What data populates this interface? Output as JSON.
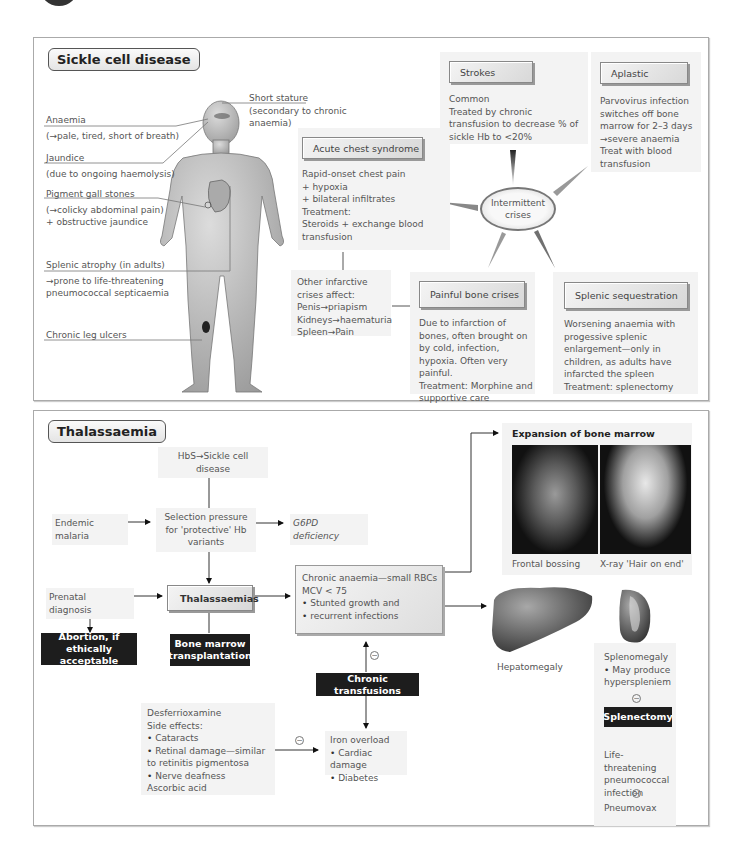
{
  "sickle": {
    "title": "Sickle cell disease",
    "body_labels": {
      "short_stature": "Short stature",
      "short_stature_note": "(secondary to chronic anaemia)",
      "anaemia": "Anaemia",
      "anaemia_note": "(→pale, tired, short of breath)",
      "jaundice": "Jaundice",
      "jaundice_note": "(due to ongoing haemolysis)",
      "gallstones": "Pigment gall stones",
      "gallstones_note1": "(→colicky abdominal pain)",
      "gallstones_note2": "+ obstructive jaundice",
      "splenic_atrophy": "Splenic atrophy (in adults)",
      "splenic_atrophy_note": "→prone to life-threatening pneumococcal septicaemia",
      "leg_ulcers": "Chronic leg ulcers"
    },
    "center": "Intermittent crises",
    "crises": {
      "strokes": {
        "title": "Strokes",
        "text": "Common\nTreated by chronic transfusion to decrease % of sickle Hb to <20%"
      },
      "aplastic": {
        "title": "Aplastic",
        "text": "Parvovirus infection switches off bone marrow for 2–3 days →severe anaemia\nTreat with blood transfusion"
      },
      "acute_chest": {
        "title": "Acute chest syndrome",
        "text": "Rapid-onset chest pain\n+ hypoxia\n+ bilateral infiltrates\nTreatment:\nSteroids + exchange blood transfusion"
      },
      "other_infarctive": {
        "text": "Other infarctive crises affect:\nPenis→priapism\nKidneys→haematuria\nSpleen→Pain"
      },
      "bone": {
        "title": "Painful bone crises",
        "text": "Due to infarction of bones, often brought on by cold, infection, hypoxia. Often very painful.\nTreatment: Morphine and supportive care"
      },
      "splenic_seq": {
        "title": "Splenic sequestration",
        "text": "Worsening anaemia with progessive splenic enlargement—only in children, as adults have infarcted the spleen\nTreatment: splenectomy"
      }
    }
  },
  "thal": {
    "title": "Thalassaemia",
    "hbs": "HbS→Sickle cell disease",
    "malaria": "Endemic malaria",
    "selection": "Selection pressure for 'protective' Hb variants",
    "g6pd": "G6PD deficiency",
    "prenatal": "Prenatal diagnosis",
    "thalassaemias": "Thalassaemias",
    "abortion": "Abortion, if ethically acceptable",
    "bmt": "Bone marrow transplantation",
    "chronic_anaemia": {
      "line1": "Chronic anaemia—small RBCs",
      "line2": "MCV < 75",
      "bullets": [
        "Stunted growth and",
        "recurrent infections"
      ]
    },
    "chronic_transfusions": "Chronic transfusions",
    "desferrioxamine": {
      "title": "Desferrioxamine",
      "side_effects": "Side effects:",
      "bullets": [
        "Cataracts",
        "Retinal damage—similar to retinitis pigmentosa",
        "Nerve deafness"
      ],
      "footer": "Ascorbic acid"
    },
    "iron_overload": {
      "title": "Iron overload",
      "bullets": [
        "Cardiac damage",
        "Diabetes"
      ]
    },
    "expansion": {
      "title": "Expansion of bone marrow",
      "caption_left": "Frontal bossing",
      "caption_right": "X-ray 'Hair on end'"
    },
    "hepatomegaly": "Hepatomegaly",
    "splenomegaly": {
      "title": "Splenomegaly",
      "bullet": "May produce hyperspleniem"
    },
    "splenectomy": "Splenectomy",
    "pneumo_infection": "Life-threatening pneumococcal infection",
    "pneumovax": "Pneumovax",
    "minus_symbol": "−"
  }
}
